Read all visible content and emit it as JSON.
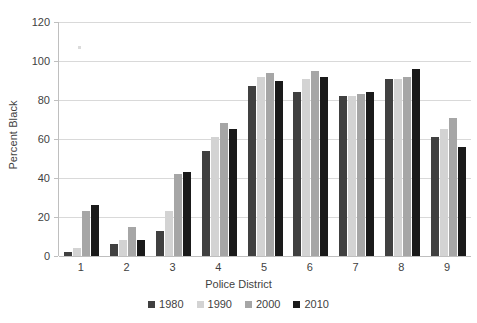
{
  "chart_data": {
    "type": "bar",
    "title": "",
    "xlabel": "Police District",
    "ylabel": "Percent Black",
    "categories": [
      "1",
      "2",
      "3",
      "4",
      "5",
      "6",
      "7",
      "8",
      "9"
    ],
    "ylim": [
      0,
      120
    ],
    "yticks": [
      0,
      20,
      40,
      60,
      80,
      100,
      120
    ],
    "ytick_labels": [
      "0",
      "20",
      "40",
      "60",
      "80",
      "100",
      "120"
    ],
    "grid": true,
    "legend_position": "bottom",
    "series": [
      {
        "name": "1980",
        "color": "#404040",
        "values": [
          2,
          6,
          13,
          54,
          87,
          84,
          82,
          91,
          61
        ]
      },
      {
        "name": "1990",
        "color": "#d3d3d3",
        "values": [
          4,
          8,
          23,
          61,
          92,
          91,
          82,
          91,
          65
        ]
      },
      {
        "name": "2000",
        "color": "#a6a6a6",
        "values": [
          23,
          15,
          42,
          68,
          94,
          95,
          83,
          92,
          71
        ]
      },
      {
        "name": "2010",
        "color": "#1a1a1a",
        "values": [
          26,
          8,
          43,
          65,
          90,
          92,
          84,
          96,
          56
        ]
      }
    ]
  },
  "axis": {
    "y_title": "Percent Black",
    "x_title": "Police District"
  }
}
